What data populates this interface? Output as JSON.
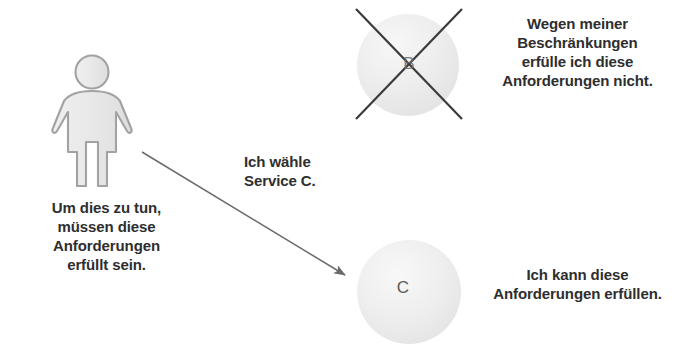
{
  "canvas": {
    "width": 689,
    "height": 351,
    "background": "#ffffff"
  },
  "figure": {
    "person": {
      "icon": "person-pictogram",
      "fill": "#e6e6e6",
      "stroke": "#9a9a9a"
    },
    "requirements_caption": "Um dies zu tun,\nmüssen diese\nAnforderungen\nerfüllt sein."
  },
  "arrow": {
    "label": "Ich wähle\nService C.",
    "color": "#6b6b6b",
    "from": "142,152",
    "to": "348,278"
  },
  "services": [
    {
      "id": "service-b",
      "letter": "B",
      "state": "rejected",
      "cross_icon": "cross-out-icon",
      "fill": "#ececed",
      "cross_color": "#3b3b3b",
      "caption": "Wegen meiner\nBeschränkungen\nerfülle ich diese\nAnforderungen nicht."
    },
    {
      "id": "service-c",
      "letter": "C",
      "state": "accepted",
      "fill": "#ececed",
      "caption": "Ich kann diese\nAnforderungen erfüllen."
    }
  ],
  "colors": {
    "text": "#2e2e2e",
    "line": "#6b6b6b",
    "circle_fill": "#ececed",
    "cross": "#3b3b3b"
  }
}
